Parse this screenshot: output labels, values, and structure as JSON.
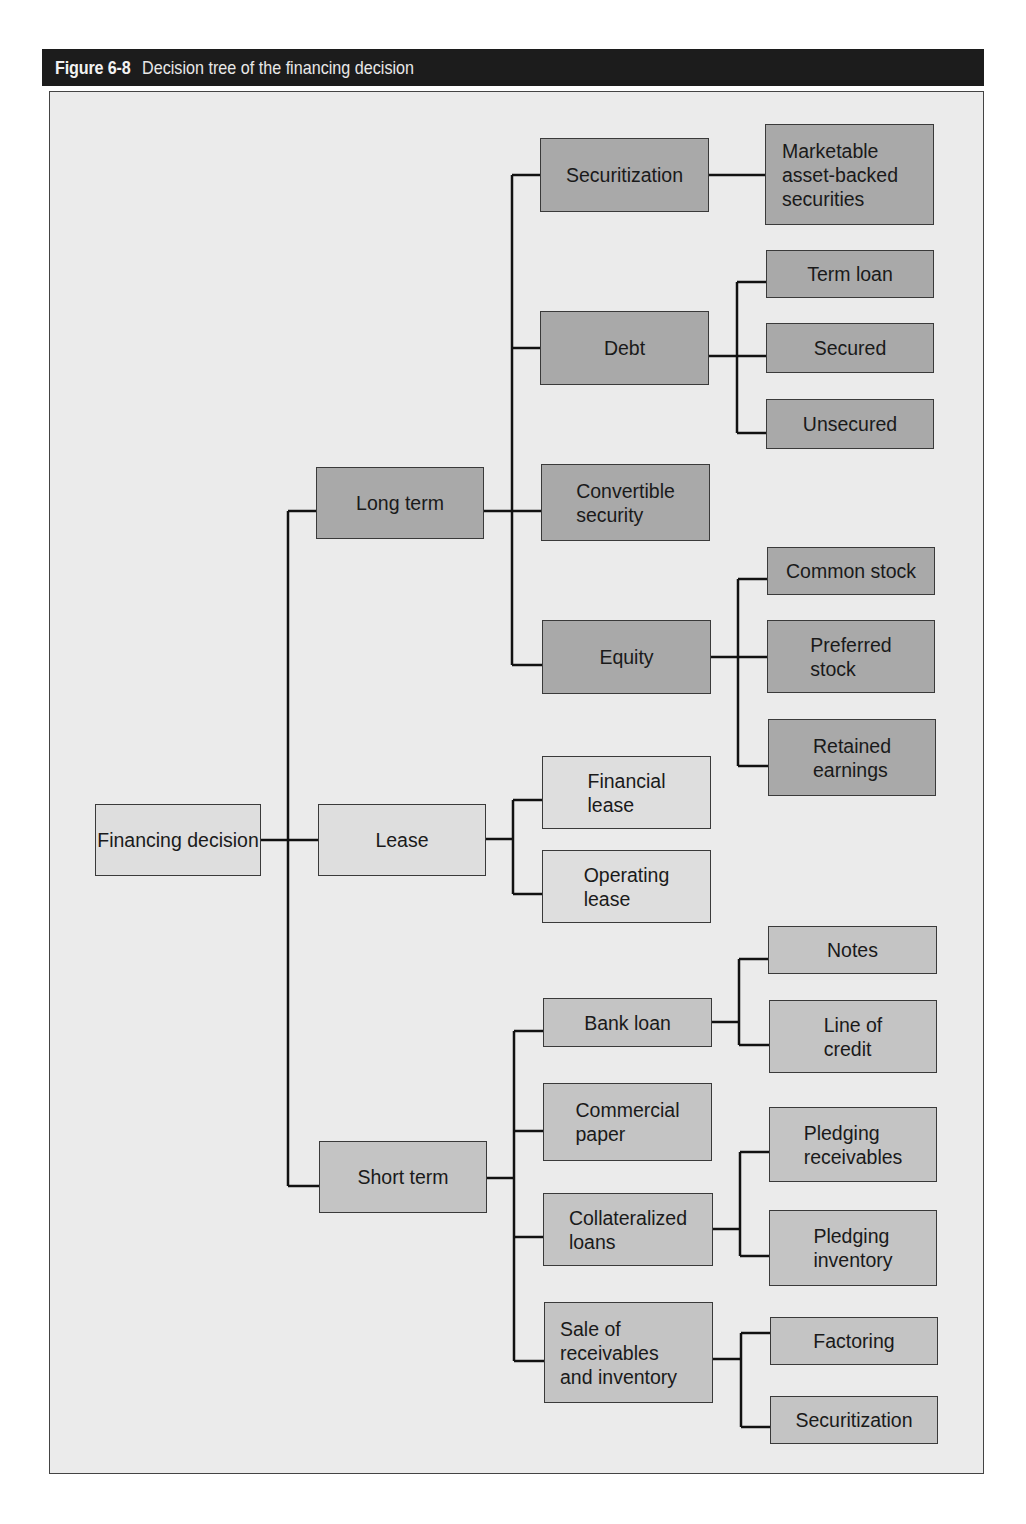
{
  "figure": {
    "number": "Figure 6-8",
    "title": "Decision tree of the financing decision"
  },
  "colors": {
    "title_bar": "#1c1c1c",
    "frame_background": "#ebebeb",
    "long_term_boxes": "#a9a9a9",
    "short_term_boxes": "#c4c4c4",
    "lease_boxes": "#dedede"
  },
  "tree": {
    "root": "Financing decision",
    "long_term": {
      "label": "Long term",
      "securitization": {
        "label": "Securitization",
        "child": "Marketable\nasset-backed\nsecurities"
      },
      "debt": {
        "label": "Debt",
        "children": [
          "Term loan",
          "Secured",
          "Unsecured"
        ]
      },
      "convertible": {
        "label": "Convertible\nsecurity"
      },
      "equity": {
        "label": "Equity",
        "children": [
          "Common stock",
          "Preferred\nstock",
          "Retained\nearnings"
        ]
      }
    },
    "lease": {
      "label": "Lease",
      "children": [
        "Financial\nlease",
        "Operating\nlease"
      ]
    },
    "short_term": {
      "label": "Short term",
      "bank_loan": {
        "label": "Bank loan",
        "children": [
          "Notes",
          "Line of\ncredit"
        ]
      },
      "commercial_paper": {
        "label": "Commercial\npaper"
      },
      "collateralized": {
        "label": "Collateralized\nloans",
        "children": [
          "Pledging\nreceivables",
          "Pledging\ninventory"
        ]
      },
      "sale": {
        "label": "Sale of\nreceivables\nand inventory",
        "children": [
          "Factoring",
          "Securitization"
        ]
      }
    }
  }
}
